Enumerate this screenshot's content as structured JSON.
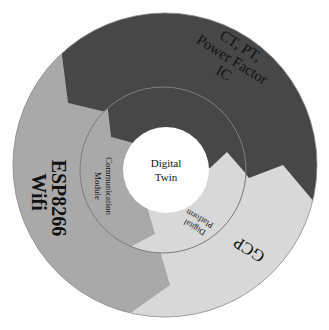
{
  "diagram": {
    "center": {
      "label_line1": "Digital",
      "label_line2": "Twin"
    },
    "inner_ring": [
      {
        "id": "sensor",
        "label": "Sensor",
        "color": "#474747"
      },
      {
        "id": "communication",
        "label_line1": "Communication",
        "label_line2": "Module",
        "color": "#a9a9a9"
      },
      {
        "id": "platform",
        "label_line1": "Digital",
        "label_line2": "Platform",
        "color": "#d8d8d8"
      }
    ],
    "outer_ring": [
      {
        "id": "hardware",
        "label_line1": "CT, PT,",
        "label_line2": "Power Factor",
        "label_line3": "IC",
        "color": "#474747"
      },
      {
        "id": "esp",
        "label_line1": "ESP8266",
        "label_line2": "Wifi",
        "color": "#a9a9a9"
      },
      {
        "id": "gcp",
        "label": "GCP",
        "color": "#d8d8d8"
      }
    ],
    "colors": {
      "dark": "#474747",
      "mid": "#a9a9a9",
      "light": "#d8d8d8",
      "ring_line": "#7a7a7a",
      "center_fill": "#ffffff"
    }
  }
}
